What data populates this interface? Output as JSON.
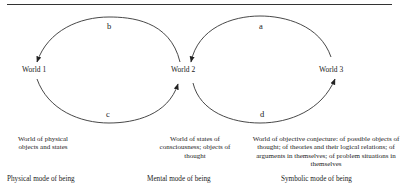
{
  "worlds": [
    {
      "label": "World 1",
      "description": "World of physical objects and states",
      "mode": "Physical mode of being"
    },
    {
      "label": "World 2",
      "description": "World of states of consciousness; objects of thought",
      "mode": "Mental mode of being"
    },
    {
      "label": "World 3",
      "description": "World of objective conjecture: of possible objects of thought; of theories  and their logical relations; of arguments in themselves; of problem  situations in themselves",
      "mode": "Symbolic mode of being"
    }
  ],
  "arrows": [
    {
      "label": "b",
      "from": "World 2",
      "to": "World 1"
    },
    {
      "label": "c",
      "from": "World 1",
      "to": "World 2"
    },
    {
      "label": "a",
      "from": "World 3",
      "to": "World 2"
    },
    {
      "label": "d",
      "from": "World 2",
      "to": "World 3"
    }
  ]
}
